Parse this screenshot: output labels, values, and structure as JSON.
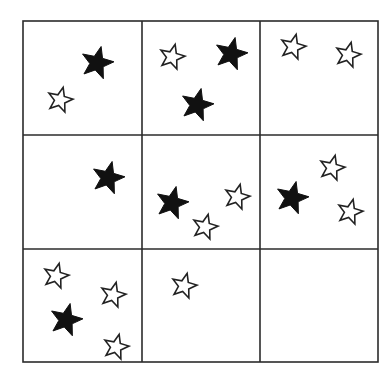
{
  "figure": {
    "grid": {
      "rows": 3,
      "cols": 3,
      "x_lines": [
        23,
        142,
        260,
        378
      ],
      "y_lines": [
        21,
        135,
        249,
        362
      ],
      "line_color": "#2b2b2b"
    },
    "colors": {
      "filled": "#111111",
      "hollow_fill": "#ffffff",
      "hollow_stroke": "#222222"
    },
    "cells": [
      {
        "row": 0,
        "col": 0,
        "filled_count": 1,
        "hollow_count": 1,
        "stars": [
          {
            "type": "filled",
            "x": 97,
            "y": 63
          },
          {
            "type": "hollow",
            "x": 60,
            "y": 100
          }
        ]
      },
      {
        "row": 0,
        "col": 1,
        "filled_count": 2,
        "hollow_count": 1,
        "stars": [
          {
            "type": "hollow",
            "x": 172,
            "y": 57
          },
          {
            "type": "filled",
            "x": 231,
            "y": 54
          },
          {
            "type": "filled",
            "x": 197,
            "y": 105
          }
        ]
      },
      {
        "row": 0,
        "col": 2,
        "filled_count": 0,
        "hollow_count": 2,
        "stars": [
          {
            "type": "hollow",
            "x": 293,
            "y": 47
          },
          {
            "type": "hollow",
            "x": 348,
            "y": 55
          }
        ]
      },
      {
        "row": 1,
        "col": 0,
        "filled_count": 1,
        "hollow_count": 0,
        "stars": [
          {
            "type": "filled",
            "x": 108,
            "y": 178
          }
        ]
      },
      {
        "row": 1,
        "col": 1,
        "filled_count": 1,
        "hollow_count": 2,
        "stars": [
          {
            "type": "filled",
            "x": 172,
            "y": 203
          },
          {
            "type": "hollow",
            "x": 237,
            "y": 197
          },
          {
            "type": "hollow",
            "x": 205,
            "y": 227
          }
        ]
      },
      {
        "row": 1,
        "col": 2,
        "filled_count": 1,
        "hollow_count": 2,
        "stars": [
          {
            "type": "hollow",
            "x": 332,
            "y": 168
          },
          {
            "type": "filled",
            "x": 292,
            "y": 198
          },
          {
            "type": "hollow",
            "x": 350,
            "y": 212
          }
        ]
      },
      {
        "row": 2,
        "col": 0,
        "filled_count": 1,
        "hollow_count": 3,
        "stars": [
          {
            "type": "hollow",
            "x": 56,
            "y": 276
          },
          {
            "type": "hollow",
            "x": 113,
            "y": 295
          },
          {
            "type": "filled",
            "x": 66,
            "y": 320
          },
          {
            "type": "hollow",
            "x": 116,
            "y": 347
          }
        ]
      },
      {
        "row": 2,
        "col": 1,
        "filled_count": 0,
        "hollow_count": 1,
        "stars": [
          {
            "type": "hollow",
            "x": 184,
            "y": 286
          }
        ]
      },
      {
        "row": 2,
        "col": 2,
        "filled_count": 0,
        "hollow_count": 0,
        "stars": []
      }
    ],
    "totals": {
      "filled": 7,
      "hollow": 12
    }
  }
}
